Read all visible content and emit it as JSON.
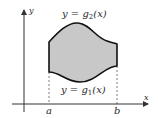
{
  "diagram": {
    "axes": {
      "x_label": "x",
      "y_label": "y"
    },
    "upper_curve": {
      "label_prefix": "y = g",
      "subscript": "2",
      "label_suffix": "(x)"
    },
    "lower_curve": {
      "label_prefix": "y = g",
      "subscript": "1",
      "label_suffix": "(x)"
    },
    "bounds": {
      "left": "a",
      "right": "b"
    },
    "colors": {
      "fill": "#c8c8c8",
      "stroke": "#111111",
      "axis": "#333333"
    }
  }
}
